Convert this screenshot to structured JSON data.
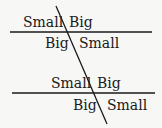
{
  "diagram": {
    "line_color": "#1a1a1a",
    "top_intersection": {
      "upper_left": "Small",
      "upper_right": "Big",
      "lower_left": "Big",
      "lower_right": "Small"
    },
    "bottom_intersection": {
      "upper_left": "Small",
      "upper_right": "Big",
      "lower_left": "Big",
      "lower_right": "Small"
    }
  }
}
